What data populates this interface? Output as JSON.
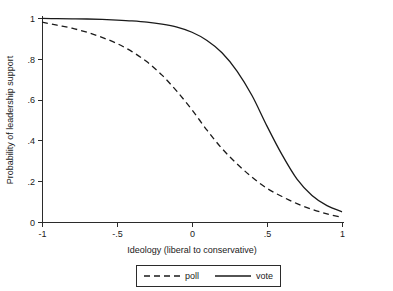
{
  "chart_data": {
    "type": "line",
    "title": "",
    "subtitle": "",
    "xlabel": "Ideology (liberal to conservative)",
    "ylabel": "Probability of leadership support",
    "xlim": [
      -1,
      1
    ],
    "ylim": [
      0,
      1
    ],
    "grid": false,
    "legend_position": "bottom-center",
    "xticks": [
      "-1",
      "-.5",
      "0",
      ".5",
      "1"
    ],
    "xtick_values": [
      -1,
      -0.5,
      0,
      0.5,
      1
    ],
    "yticks": [
      "0",
      ".2",
      ".4",
      ".6",
      ".8",
      "1"
    ],
    "ytick_values": [
      0,
      0.2,
      0.4,
      0.6,
      0.8,
      1
    ],
    "x": [
      -1,
      -0.9,
      -0.8,
      -0.7,
      -0.6,
      -0.5,
      -0.4,
      -0.3,
      -0.2,
      -0.1,
      0,
      0.1,
      0.2,
      0.3,
      0.4,
      0.5,
      0.6,
      0.7,
      0.8,
      0.9,
      1
    ],
    "series": [
      {
        "name": "poll",
        "style": "dashed",
        "color": "#1a1a1a",
        "values": [
          0.98,
          0.965,
          0.95,
          0.93,
          0.905,
          0.875,
          0.835,
          0.785,
          0.72,
          0.64,
          0.55,
          0.45,
          0.36,
          0.285,
          0.22,
          0.165,
          0.125,
          0.09,
          0.062,
          0.04,
          0.022
        ]
      },
      {
        "name": "vote",
        "style": "solid",
        "color": "#1a1a1a",
        "values": [
          0.998,
          0.997,
          0.996,
          0.995,
          0.993,
          0.99,
          0.986,
          0.98,
          0.97,
          0.955,
          0.93,
          0.89,
          0.83,
          0.74,
          0.62,
          0.47,
          0.33,
          0.21,
          0.13,
          0.08,
          0.05
        ]
      }
    ]
  },
  "legend": {
    "entries": [
      {
        "label": "poll"
      },
      {
        "label": "vote"
      }
    ]
  }
}
